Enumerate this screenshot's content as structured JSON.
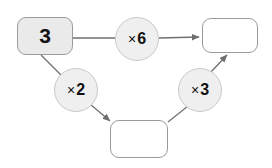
{
  "diagram": {
    "type": "function-machine-flowchart",
    "background_color": "#ffffff",
    "node_fill_filled": "#eaeaea",
    "node_fill_empty": "#ffffff",
    "circle_fill": "#efefef",
    "stroke_color": "#9a9a9a",
    "nodes": {
      "input_box": {
        "label": "3",
        "filled": true
      },
      "output_box_top": {
        "label": "",
        "filled": false
      },
      "output_box_bottom": {
        "label": "",
        "filled": false
      },
      "operation_six": {
        "sign": "×",
        "operand": "6",
        "label": "× 6"
      },
      "operation_two": {
        "sign": "×",
        "operand": "2",
        "label": "× 2"
      },
      "operation_three": {
        "sign": "×",
        "operand": "3",
        "label": "× 3"
      }
    },
    "edges": [
      {
        "from": "input_box",
        "to": "operation_six",
        "arrow": false
      },
      {
        "from": "operation_six",
        "to": "output_box_top",
        "arrow": true
      },
      {
        "from": "input_box",
        "to": "operation_two",
        "arrow": false
      },
      {
        "from": "operation_two",
        "to": "output_box_bottom",
        "arrow": true
      },
      {
        "from": "output_box_bottom",
        "to": "operation_three",
        "arrow": false
      },
      {
        "from": "operation_three",
        "to": "output_box_top",
        "arrow": true
      }
    ]
  }
}
